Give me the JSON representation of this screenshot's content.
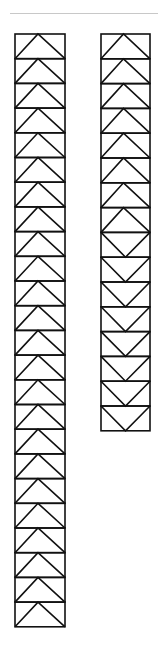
{
  "header": {
    "cropped_text": "",
    "rule_color": "#c8c8c8"
  },
  "diagram": {
    "stroke_color": "#111111",
    "stroke_width": 1.6,
    "strips": [
      {
        "id": "left-strip",
        "x": 15,
        "y": 34,
        "width": 50,
        "cell_height": 24.7,
        "cells": [
          "up",
          "up",
          "up",
          "up",
          "up",
          "up",
          "up",
          "up",
          "up",
          "up",
          "up",
          "up",
          "up",
          "up",
          "up",
          "up",
          "up",
          "up",
          "up",
          "up",
          "up",
          "up",
          "up",
          "up"
        ]
      },
      {
        "id": "right-strip",
        "x": 101,
        "y": 34,
        "width": 49,
        "cell_height": 24.8,
        "cells": [
          "up",
          "up",
          "up",
          "up",
          "up",
          "up",
          "up",
          "up",
          "down",
          "down",
          "down",
          "down",
          "down",
          "down",
          "down",
          "down"
        ]
      }
    ]
  }
}
